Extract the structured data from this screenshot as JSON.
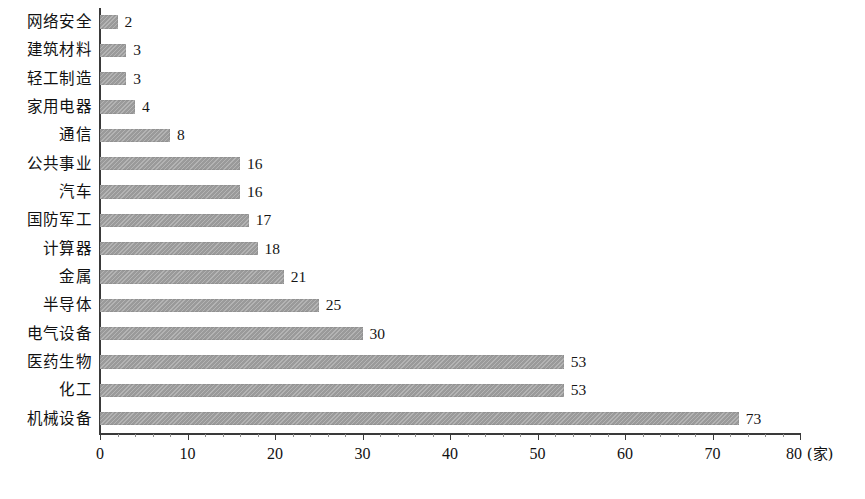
{
  "chart_data": {
    "type": "bar",
    "orientation": "horizontal",
    "title": "",
    "subtitle": "",
    "xlabel": "(家)",
    "ylabel": "",
    "xlim": [
      0,
      80
    ],
    "grid": false,
    "legend": null,
    "bar_color": "#9a9a9a",
    "axis_color": "#3a3a3a",
    "x_ticks": [
      0,
      10,
      20,
      30,
      40,
      50,
      60,
      70,
      80
    ],
    "x_tick_labels": [
      "0",
      "10",
      "20",
      "30",
      "40",
      "50",
      "60",
      "70",
      "80"
    ],
    "x_minor_tick_step": 2,
    "unit_suffix": "(家)",
    "categories": [
      "网络安全",
      "建筑材料",
      "轻工制造",
      "家用电器",
      "通信",
      "公共事业",
      "汽车",
      "国防军工",
      "计算器",
      "金属",
      "半导体",
      "电气设备",
      "医药生物",
      "化工",
      "机械设备"
    ],
    "values": [
      2,
      3,
      3,
      4,
      8,
      16,
      16,
      17,
      18,
      21,
      25,
      30,
      53,
      53,
      73
    ],
    "value_labels": [
      "2",
      "3",
      "3",
      "4",
      "8",
      "16",
      "16",
      "17",
      "18",
      "21",
      "25",
      "30",
      "53",
      "53",
      "73"
    ]
  }
}
